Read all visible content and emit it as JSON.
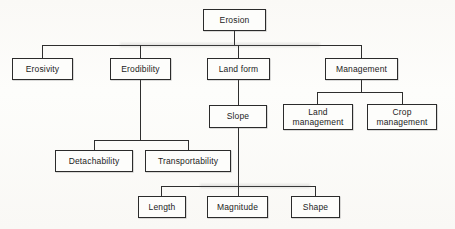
{
  "diagram": {
    "type": "tree",
    "background_color": "#fbfbf9",
    "line_color": "#2e2e2e",
    "text_color": "#1c1c1c",
    "nodes": {
      "erosion": "Erosion",
      "erosivity": "Erosivity",
      "erodibility": "Erodibility",
      "land_form": "Land form",
      "management": "Management",
      "slope": "Slope",
      "land_management": "Land\nmanagement",
      "crop_management": "Crop\nmanagement",
      "detachability": "Detachability",
      "transportability": "Transportability",
      "length": "Length",
      "magnitude": "Magnitude",
      "shape": "Shape"
    },
    "levels": [
      [
        "Erosion"
      ],
      [
        "Erosivity",
        "Erodibility",
        "Land form",
        "Management"
      ],
      [
        "Slope",
        "Land management",
        "Crop management"
      ],
      [
        "Detachability",
        "Transportability"
      ],
      [
        "Length",
        "Magnitude",
        "Shape"
      ]
    ],
    "edges": [
      {
        "from": "Erosion",
        "to": "Erosivity"
      },
      {
        "from": "Erosion",
        "to": "Erodibility"
      },
      {
        "from": "Erosion",
        "to": "Land form"
      },
      {
        "from": "Erosion",
        "to": "Management"
      },
      {
        "from": "Erodibility",
        "to": "Detachability"
      },
      {
        "from": "Erodibility",
        "to": "Transportability"
      },
      {
        "from": "Land form",
        "to": "Slope"
      },
      {
        "from": "Management",
        "to": "Land management"
      },
      {
        "from": "Management",
        "to": "Crop management"
      },
      {
        "from": "Slope",
        "to": "Length"
      },
      {
        "from": "Slope",
        "to": "Magnitude"
      },
      {
        "from": "Slope",
        "to": "Shape"
      }
    ]
  }
}
